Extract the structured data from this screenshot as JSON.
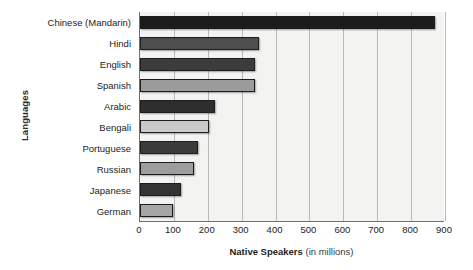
{
  "chart_data": {
    "type": "bar",
    "orientation": "horizontal",
    "title": "",
    "xlabel": "Native Speakers (in millions)",
    "xlabel_strong": "Native Speakers",
    "xlabel_light": "(in millions)",
    "ylabel": "Languages",
    "categories": [
      "Chinese (Mandarin)",
      "Hindi",
      "English",
      "Spanish",
      "Arabic",
      "Bengali",
      "Portuguese",
      "Russian",
      "Japanese",
      "German"
    ],
    "values": [
      870,
      350,
      340,
      340,
      222,
      205,
      170,
      160,
      122,
      98
    ],
    "bar_colors": [
      "#1c1c1c",
      "#4e4e4e",
      "#3c3c3c",
      "#9b9b9b",
      "#2e2e2e",
      "#c9c9c9",
      "#3b3b3b",
      "#9d9d9d",
      "#333333",
      "#a6a6a6"
    ],
    "xlim": [
      0,
      900
    ],
    "xticks": [
      0,
      100,
      200,
      300,
      400,
      500,
      600,
      700,
      800,
      900
    ],
    "xtick_labels": [
      "0",
      "100",
      "200",
      "300",
      "400",
      "500",
      "600",
      "700",
      "800",
      "900"
    ],
    "grid": "vertical",
    "legend": "none",
    "plot_background": "#f3f3f1",
    "axis_color": "#6f6f6f",
    "gridline_color": "#b9b9b7"
  }
}
